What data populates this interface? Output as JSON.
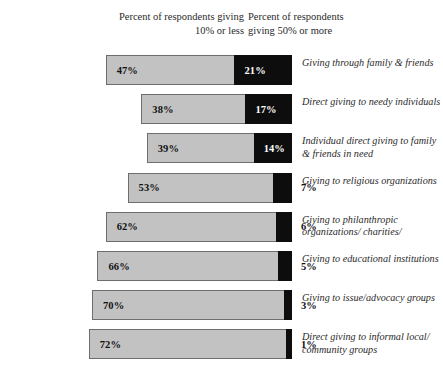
{
  "headers": {
    "left": "Percent of respondents giving\n10% or less",
    "right": "Percent of respondents\ngiving 50% or more"
  },
  "chart_data": {
    "type": "bar",
    "orientation": "horizontal",
    "stacked": true,
    "title": "",
    "xlabel": "",
    "ylabel": "",
    "grid": false,
    "legend_position": "top",
    "series": [
      {
        "name": "Percent of respondents giving 10% or less",
        "color": "#c2c2c2",
        "values": [
          47,
          38,
          39,
          53,
          62,
          66,
          70,
          72
        ]
      },
      {
        "name": "Percent of respondents giving 50% or more",
        "color": "#0d0d0d",
        "values": [
          21,
          17,
          14,
          7,
          6,
          5,
          3,
          1
        ]
      }
    ],
    "categories": [
      "Giving through family & friends",
      "Direct giving to needy individuals",
      "Individual direct giving to family & friends in need",
      "Giving to religious organizations",
      "Giving to philanthropic organizations/ charities/",
      "Giving to educational institutions",
      "Giving to issue/advocacy groups",
      "Direct giving to informal local/ community groups"
    ],
    "value_labels_light": [
      "47%",
      "38%",
      "39%",
      "53%",
      "62%",
      "66%",
      "70%",
      "72%"
    ],
    "value_labels_dark": [
      "21%",
      "17%",
      "14%",
      "7%",
      "6%",
      "5%",
      "3%",
      "1%"
    ]
  },
  "rows": [
    {
      "label": "Giving through family & friends",
      "light_label": "47%",
      "dark_label": "21%",
      "dark_inside": true
    },
    {
      "label": "Direct giving to needy individuals",
      "light_label": "38%",
      "dark_label": "17%",
      "dark_inside": true
    },
    {
      "label": "Individual direct giving to family & friends in need",
      "light_label": "39%",
      "dark_label": "14%",
      "dark_inside": true
    },
    {
      "label": "Giving to religious organizations",
      "light_label": "53%",
      "dark_label": "7%",
      "dark_inside": false
    },
    {
      "label": "Giving to philanthropic organizations/ charities/",
      "light_label": "62%",
      "dark_label": "6%",
      "dark_inside": false
    },
    {
      "label": "Giving to educational institutions",
      "light_label": "66%",
      "dark_label": "5%",
      "dark_inside": false
    },
    {
      "label": "Giving to issue/advocacy groups",
      "light_label": "70%",
      "dark_label": "3%",
      "dark_inside": false
    },
    {
      "label": "Direct giving to informal local/ community groups",
      "light_label": "72%",
      "dark_label": "1%",
      "dark_inside": false
    }
  ]
}
